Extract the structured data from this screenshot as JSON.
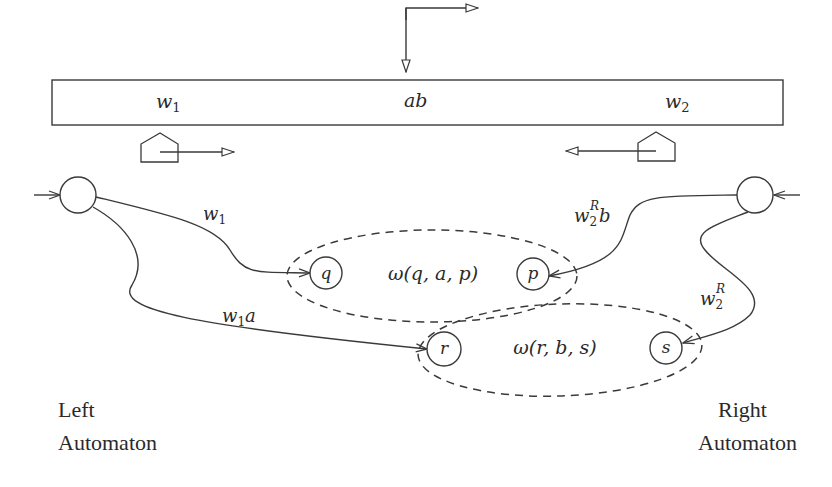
{
  "tape": {
    "cells": [
      {
        "label": "w",
        "sub": "1"
      },
      {
        "label": "ab"
      },
      {
        "label": "w",
        "sub": "2"
      }
    ]
  },
  "heads": {
    "left": {
      "direction": "right"
    },
    "right": {
      "direction": "left"
    },
    "top_indicator": {
      "direction": "down-then-right"
    }
  },
  "left_automaton": {
    "label_line1": "Left",
    "label_line2": "Automaton",
    "edges": [
      {
        "label_main": "w",
        "label_sub": "1",
        "label_tail": "",
        "target": "q"
      },
      {
        "label_main": "w",
        "label_sub": "1",
        "label_tail": "a",
        "target": "r"
      }
    ]
  },
  "right_automaton": {
    "label_line1": "Right",
    "label_line2": "Automaton",
    "edges": [
      {
        "label_main": "w",
        "label_sub": "2",
        "label_sup": "R",
        "label_tail": "b",
        "target": "p"
      },
      {
        "label_main": "w",
        "label_sub": "2",
        "label_sup": "R",
        "label_tail": "",
        "target": "s"
      }
    ]
  },
  "states": {
    "q": "q",
    "p": "p",
    "r": "r",
    "s": "s"
  },
  "groups": [
    {
      "label": "ω(q, a, p)"
    },
    {
      "label": "ω(r, b, s)"
    }
  ]
}
